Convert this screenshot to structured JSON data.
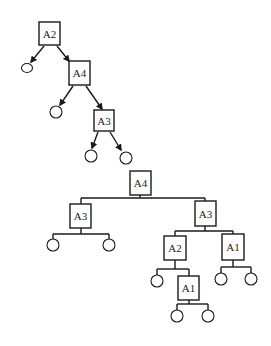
{
  "diagram": {
    "title": "",
    "tree1": {
      "nodes": [
        {
          "id": "t1-a2",
          "label": "A2",
          "x": 39,
          "y": 22,
          "w": 21,
          "h": 23
        },
        {
          "id": "t1-a4",
          "label": "A4",
          "x": 69,
          "y": 61,
          "w": 21,
          "h": 24
        },
        {
          "id": "t1-a3",
          "label": "A3",
          "x": 94,
          "y": 110,
          "w": 20,
          "h": 21
        }
      ],
      "leaves": [
        {
          "id": "t1-l1",
          "cx": 27,
          "cy": 68,
          "rx": 5.5,
          "ry": 4.5
        },
        {
          "id": "t1-l2",
          "cx": 56,
          "cy": 112,
          "rx": 6,
          "ry": 6
        },
        {
          "id": "t1-l3",
          "cx": 91,
          "cy": 156,
          "rx": 6,
          "ry": 6
        },
        {
          "id": "t1-l4",
          "cx": 126,
          "cy": 158,
          "rx": 6,
          "ry": 6
        }
      ],
      "arrows": [
        {
          "x1": 44,
          "y1": 46,
          "x2": 31,
          "y2": 62
        },
        {
          "x1": 57,
          "y1": 46,
          "x2": 69,
          "y2": 61
        },
        {
          "x1": 73,
          "y1": 86,
          "x2": 60,
          "y2": 105
        },
        {
          "x1": 86,
          "y1": 86,
          "x2": 102,
          "y2": 109
        },
        {
          "x1": 98,
          "y1": 132,
          "x2": 92,
          "y2": 148
        },
        {
          "x1": 110,
          "y1": 132,
          "x2": 121,
          "y2": 150
        }
      ]
    },
    "tree2": {
      "nodes": [
        {
          "id": "t2-a4",
          "label": "A4",
          "x": 130,
          "y": 171,
          "w": 21,
          "h": 24
        },
        {
          "id": "t2-a3-left",
          "label": "A3",
          "x": 70,
          "y": 204,
          "w": 21,
          "h": 24
        },
        {
          "id": "t2-a3-right",
          "label": "A3",
          "x": 195,
          "y": 201,
          "w": 21,
          "h": 25
        },
        {
          "id": "t2-a2",
          "label": "A2",
          "x": 164,
          "y": 236,
          "w": 22,
          "h": 24
        },
        {
          "id": "t2-a1-right",
          "label": "A1",
          "x": 222,
          "y": 234,
          "w": 22,
          "h": 26
        },
        {
          "id": "t2-a1-bottom",
          "label": "A1",
          "x": 178,
          "y": 276,
          "w": 21,
          "h": 24
        }
      ],
      "leaves": [
        {
          "id": "t2-l1",
          "cx": 53,
          "cy": 245,
          "rx": 6,
          "ry": 6
        },
        {
          "id": "t2-l2",
          "cx": 109,
          "cy": 245,
          "rx": 6,
          "ry": 6
        },
        {
          "id": "t2-l3",
          "cx": 157,
          "cy": 281,
          "rx": 6,
          "ry": 6
        },
        {
          "id": "t2-l4",
          "cx": 221,
          "cy": 279,
          "rx": 6,
          "ry": 6
        },
        {
          "id": "t2-l5",
          "cx": 251,
          "cy": 279,
          "rx": 6,
          "ry": 6
        },
        {
          "id": "t2-l6",
          "cx": 177,
          "cy": 316,
          "rx": 6,
          "ry": 6
        },
        {
          "id": "t2-l7",
          "cx": 208,
          "cy": 316,
          "rx": 6,
          "ry": 6
        }
      ],
      "lines": [
        {
          "x1": 140,
          "y1": 195,
          "x2": 140,
          "y2": 198
        },
        {
          "x1": 81,
          "y1": 198,
          "x2": 205,
          "y2": 198
        },
        {
          "x1": 81,
          "y1": 198,
          "x2": 81,
          "y2": 204
        },
        {
          "x1": 205,
          "y1": 198,
          "x2": 205,
          "y2": 201
        },
        {
          "x1": 81,
          "y1": 228,
          "x2": 81,
          "y2": 234
        },
        {
          "x1": 53,
          "y1": 234,
          "x2": 109,
          "y2": 234
        },
        {
          "x1": 53,
          "y1": 234,
          "x2": 53,
          "y2": 239
        },
        {
          "x1": 109,
          "y1": 234,
          "x2": 109,
          "y2": 239
        },
        {
          "x1": 205,
          "y1": 226,
          "x2": 205,
          "y2": 231
        },
        {
          "x1": 175,
          "y1": 231,
          "x2": 233,
          "y2": 231
        },
        {
          "x1": 175,
          "y1": 231,
          "x2": 175,
          "y2": 236
        },
        {
          "x1": 233,
          "y1": 231,
          "x2": 233,
          "y2": 234
        },
        {
          "x1": 175,
          "y1": 260,
          "x2": 175,
          "y2": 269
        },
        {
          "x1": 157,
          "y1": 269,
          "x2": 189,
          "y2": 269
        },
        {
          "x1": 157,
          "y1": 269,
          "x2": 157,
          "y2": 275
        },
        {
          "x1": 189,
          "y1": 269,
          "x2": 189,
          "y2": 276
        },
        {
          "x1": 233,
          "y1": 260,
          "x2": 233,
          "y2": 267
        },
        {
          "x1": 221,
          "y1": 267,
          "x2": 251,
          "y2": 267
        },
        {
          "x1": 221,
          "y1": 267,
          "x2": 221,
          "y2": 273
        },
        {
          "x1": 251,
          "y1": 267,
          "x2": 251,
          "y2": 273
        },
        {
          "x1": 189,
          "y1": 300,
          "x2": 189,
          "y2": 304
        },
        {
          "x1": 177,
          "y1": 304,
          "x2": 208,
          "y2": 304
        },
        {
          "x1": 177,
          "y1": 304,
          "x2": 177,
          "y2": 310
        },
        {
          "x1": 208,
          "y1": 304,
          "x2": 208,
          "y2": 310
        }
      ]
    }
  }
}
